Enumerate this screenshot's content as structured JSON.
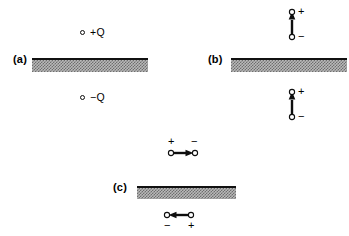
{
  "figure": {
    "width": 349,
    "height": 236,
    "background": "#ffffff",
    "ink_color": "#000000",
    "slab_fill": "#b9b9b9",
    "slab_stipple": "#6e6e6e",
    "slab_edge": "#111111"
  },
  "panels": [
    {
      "id": "a",
      "label": "(a)",
      "label_x": 13,
      "label_y": 53,
      "slab": {
        "x": 32,
        "y": 58,
        "width": 116,
        "height": 14
      },
      "charges": [
        {
          "name": "charge-positive-q",
          "text": "+Q",
          "circle_x": 80,
          "circle_y": 29,
          "polarity": "+"
        },
        {
          "name": "charge-negative-q",
          "text": "−Q",
          "circle_x": 80,
          "circle_y": 94,
          "polarity": "−"
        }
      ]
    },
    {
      "id": "b",
      "label": "(b)",
      "label_x": 208,
      "label_y": 53,
      "slab": {
        "x": 231,
        "y": 58,
        "width": 116,
        "height": 14
      },
      "dipoles": [
        {
          "name": "dipole-above-plate",
          "orientation": "vertical",
          "arrow_direction": "up",
          "x": 288,
          "y": 10,
          "length": 26,
          "top_sign": "+",
          "bottom_sign": "−"
        },
        {
          "name": "dipole-below-plate",
          "orientation": "vertical",
          "arrow_direction": "up",
          "x": 288,
          "y": 90,
          "length": 26,
          "top_sign": "+",
          "bottom_sign": "−"
        }
      ]
    },
    {
      "id": "c",
      "label": "(c)",
      "label_x": 113,
      "label_y": 181,
      "slab": {
        "x": 137,
        "y": 186,
        "width": 99,
        "height": 13
      },
      "dipoles": [
        {
          "name": "dipole-above-plate",
          "orientation": "horizontal",
          "arrow_direction": "right",
          "x": 169,
          "y": 146,
          "length": 27,
          "left_sign": "+",
          "right_sign": "−",
          "signs_position": "above"
        },
        {
          "name": "dipole-below-plate",
          "orientation": "horizontal",
          "arrow_direction": "left",
          "x": 165,
          "y": 214,
          "length": 27,
          "left_sign": "−",
          "right_sign": "+",
          "signs_position": "below"
        }
      ]
    }
  ]
}
